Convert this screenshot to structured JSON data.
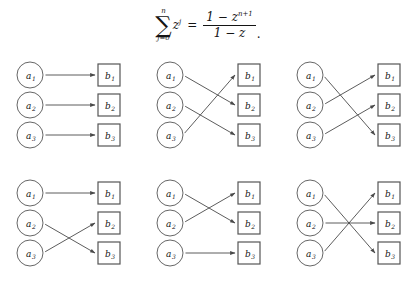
{
  "formula": {
    "summation_upper": "n",
    "summation_symbol": "∑",
    "summation_lower": "j=0",
    "summand_base": "z",
    "summand_exponent": "j",
    "equals": "=",
    "numerator_text": "1 − z",
    "numerator_exponent": "n+1",
    "denominator": "1 − z",
    "trailing_punctuation": ".",
    "plain_text": "∑ j=0..n z^j = (1 − z^{n+1}) / (1 − z)."
  },
  "style": {
    "background": "#ffffff",
    "circle_stroke": "#555555",
    "box_stroke": "#555555",
    "edge_stroke": "#4a4a4a",
    "text_color": "#141414"
  },
  "diagram_common": {
    "domain_labels": [
      "a1",
      "a2",
      "a3"
    ],
    "codomain_labels": [
      "b1",
      "b2",
      "b3"
    ],
    "domain_base": "a",
    "codomain_base": "b",
    "subscripts": [
      "1",
      "2",
      "3"
    ],
    "domain_shape": "circle",
    "codomain_shape": "square"
  },
  "panels": [
    {
      "id": "panel-1",
      "name": "identity-permutation",
      "mapping": [
        1,
        2,
        3
      ],
      "edges": [
        {
          "from": "a1",
          "to": "b1"
        },
        {
          "from": "a2",
          "to": "b2"
        },
        {
          "from": "a3",
          "to": "b3"
        }
      ]
    },
    {
      "id": "panel-2",
      "name": "cycle-123",
      "mapping": [
        2,
        3,
        1
      ],
      "edges": [
        {
          "from": "a1",
          "to": "b2"
        },
        {
          "from": "a2",
          "to": "b3"
        },
        {
          "from": "a3",
          "to": "b1"
        }
      ]
    },
    {
      "id": "panel-3",
      "name": "cycle-132",
      "mapping": [
        3,
        1,
        2
      ],
      "edges": [
        {
          "from": "a1",
          "to": "b3"
        },
        {
          "from": "a2",
          "to": "b1"
        },
        {
          "from": "a3",
          "to": "b2"
        }
      ]
    },
    {
      "id": "panel-4",
      "name": "transposition-23",
      "mapping": [
        1,
        3,
        2
      ],
      "edges": [
        {
          "from": "a1",
          "to": "b1"
        },
        {
          "from": "a2",
          "to": "b3"
        },
        {
          "from": "a3",
          "to": "b2"
        }
      ]
    },
    {
      "id": "panel-5",
      "name": "transposition-12",
      "mapping": [
        2,
        1,
        3
      ],
      "edges": [
        {
          "from": "a1",
          "to": "b2"
        },
        {
          "from": "a2",
          "to": "b1"
        },
        {
          "from": "a3",
          "to": "b3"
        }
      ]
    },
    {
      "id": "panel-6",
      "name": "transposition-13",
      "mapping": [
        3,
        2,
        1
      ],
      "edges": [
        {
          "from": "a1",
          "to": "b3"
        },
        {
          "from": "a2",
          "to": "b2"
        },
        {
          "from": "a3",
          "to": "b1"
        }
      ]
    }
  ]
}
